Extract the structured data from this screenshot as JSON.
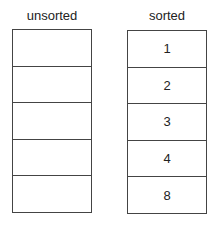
{
  "unsorted": {
    "label": "unsorted",
    "cells": [
      "",
      "",
      "",
      "",
      ""
    ]
  },
  "sorted": {
    "label": "sorted",
    "cells": [
      "1",
      "2",
      "3",
      "4",
      "8"
    ]
  }
}
